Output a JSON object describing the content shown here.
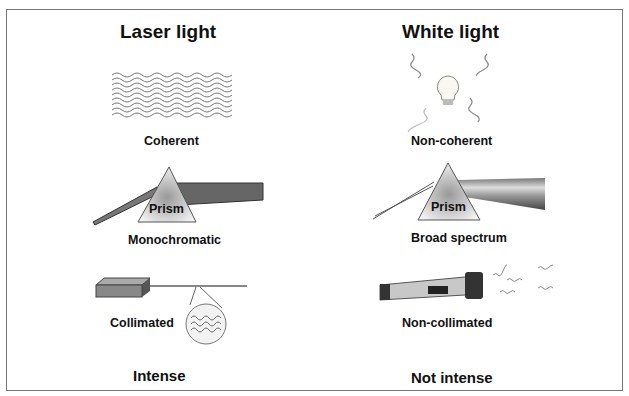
{
  "columns": [
    {
      "title": "Laser light",
      "properties": [
        "Coherent",
        "Monochromatic",
        "Collimated",
        "Intense"
      ],
      "prism_label": "Prism"
    },
    {
      "title": "White light",
      "properties": [
        "Non-coherent",
        "Broad spectrum",
        "Non-collimated",
        "Not intense"
      ],
      "prism_label": "Prism"
    }
  ],
  "icons": [
    "laser-wave-icon",
    "light-bulb-icon",
    "prism-icon",
    "laser-device-icon",
    "magnifier-wave-icon",
    "flashlight-icon"
  ]
}
